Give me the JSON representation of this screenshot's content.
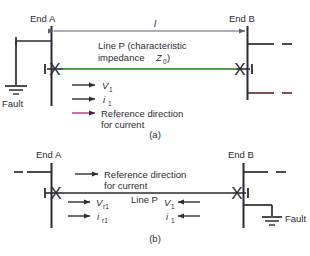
{
  "figure": {
    "title_a": "(a)",
    "title_b": "(b)",
    "colors": {
      "ink": "#2b2b33",
      "line_p": "#4f9f4a",
      "dimension": "#5a5f75",
      "reference_arrow": "#d45aa8",
      "stub_lower": "#6b2f2f",
      "background": "#ffffff"
    }
  },
  "diagram_a": {
    "end_a_label": "End A",
    "end_b_label": "End B",
    "length_label": "l",
    "line_label_line1": "Line P (characteristic",
    "line_label_line2": "impedance",
    "line_label_z": "Z",
    "line_label_z_sub": "0",
    "line_label_close": ")",
    "fault_label": "Fault",
    "voltage_symbol": "V",
    "voltage_sub": "1",
    "current_symbol": "i",
    "current_sub": "1",
    "reference_line1": "Reference direction",
    "reference_line2": "for current",
    "breaker_symbol": "X",
    "caption": "(a)"
  },
  "diagram_b": {
    "end_a_label": "End A",
    "end_b_label": "End B",
    "reference_line1": "Reference direction",
    "reference_line2": "for current",
    "line_label": "Line P",
    "left_voltage_symbol": "V",
    "left_voltage_sub": "r1",
    "left_current_symbol": "i",
    "left_current_sub": "r1",
    "right_voltage_symbol": "V",
    "right_voltage_sub": "1",
    "right_current_symbol": "i",
    "right_current_sub": "1",
    "fault_label": "Fault",
    "breaker_symbol": "X",
    "caption": "(b)"
  }
}
